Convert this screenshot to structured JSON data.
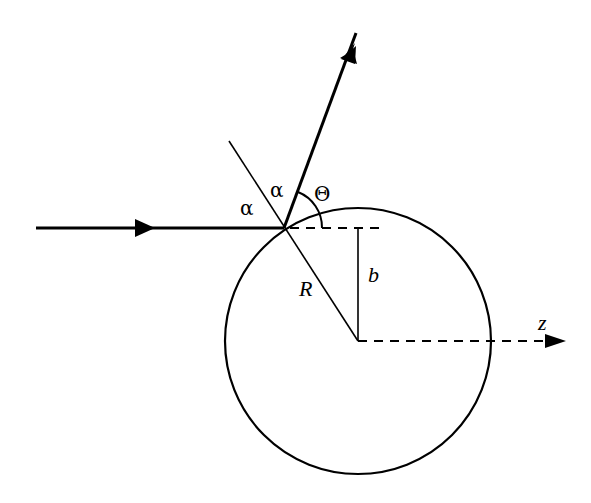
{
  "diagram": {
    "colors": {
      "stroke": "#000000",
      "background": "#ffffff"
    },
    "labels": {
      "alpha_incident": "α",
      "alpha_reflected": "α",
      "theta": "Θ",
      "radius": "R",
      "impact_parameter": "b",
      "axis": "z"
    },
    "elements": [
      "incident-ray-with-arrow",
      "reflected-ray-with-arrow",
      "surface-normal-line",
      "sphere-circle",
      "impact-parameter-line",
      "horizontal-dashed-reference",
      "z-axis-dashed-with-arrow",
      "scattering-angle-arc"
    ]
  }
}
